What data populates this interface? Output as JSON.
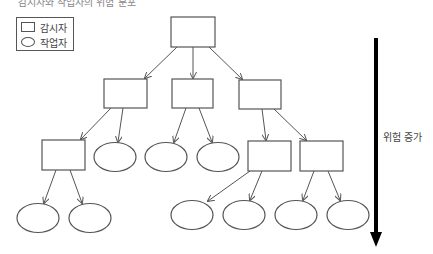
{
  "caption": "감시자와 작업자의 위험 분포",
  "legend": {
    "items": [
      {
        "shape": "rectangle",
        "label": "감시자"
      },
      {
        "shape": "ellipse",
        "label": "작업자"
      }
    ]
  },
  "risk_arrow": {
    "label": "위험 증가",
    "direction": "down"
  },
  "colors": {
    "stroke": "#555555",
    "arrow": "#000000",
    "background": "#ffffff"
  },
  "nodes": [
    {
      "id": "s0",
      "type": "supervisor",
      "level": 0
    },
    {
      "id": "s1",
      "type": "supervisor",
      "level": 1
    },
    {
      "id": "s2",
      "type": "supervisor",
      "level": 1
    },
    {
      "id": "s3",
      "type": "supervisor",
      "level": 1
    },
    {
      "id": "s4",
      "type": "supervisor",
      "level": 2
    },
    {
      "id": "w1",
      "type": "worker",
      "level": 2
    },
    {
      "id": "w2",
      "type": "worker",
      "level": 2
    },
    {
      "id": "w3",
      "type": "worker",
      "level": 2
    },
    {
      "id": "s5",
      "type": "supervisor",
      "level": 2
    },
    {
      "id": "s6",
      "type": "supervisor",
      "level": 2
    },
    {
      "id": "w4",
      "type": "worker",
      "level": 3
    },
    {
      "id": "w5",
      "type": "worker",
      "level": 3
    },
    {
      "id": "w6",
      "type": "worker",
      "level": 3
    },
    {
      "id": "w7",
      "type": "worker",
      "level": 3
    },
    {
      "id": "w8",
      "type": "worker",
      "level": 3
    },
    {
      "id": "w9",
      "type": "worker",
      "level": 3
    }
  ],
  "edges": [
    [
      "s0",
      "s1"
    ],
    [
      "s0",
      "s2"
    ],
    [
      "s0",
      "s3"
    ],
    [
      "s1",
      "s4"
    ],
    [
      "s1",
      "w1"
    ],
    [
      "s2",
      "w2"
    ],
    [
      "s2",
      "w3"
    ],
    [
      "s3",
      "s5"
    ],
    [
      "s3",
      "s6"
    ],
    [
      "s4",
      "w4"
    ],
    [
      "s4",
      "w5"
    ],
    [
      "s5",
      "w6"
    ],
    [
      "s5",
      "w7"
    ],
    [
      "s6",
      "w8"
    ],
    [
      "s6",
      "w9"
    ]
  ]
}
